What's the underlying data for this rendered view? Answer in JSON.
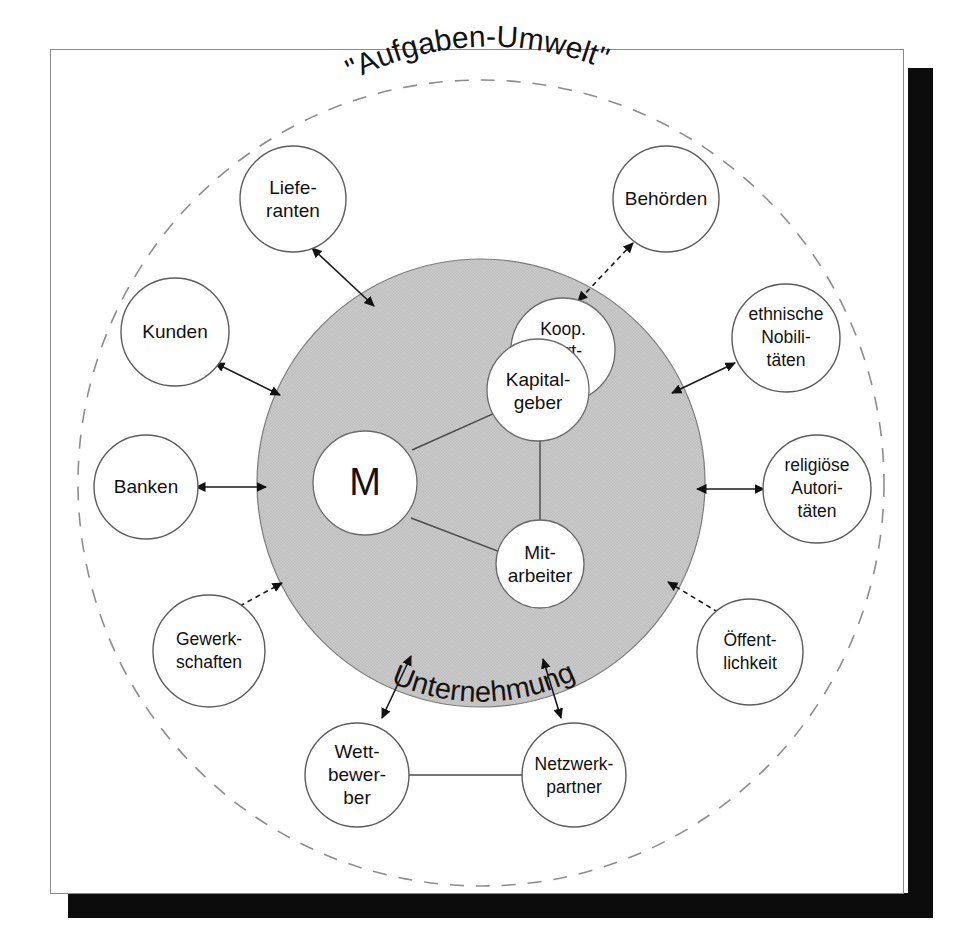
{
  "figure": {
    "title": "\"Aufgaben-Umwelt\"",
    "inner_region_label": "Unternehmung",
    "center_node": "M"
  },
  "inner_nodes": [
    {
      "id": "kapitalgeber",
      "lines": [
        "Kapital-",
        "geber"
      ]
    },
    {
      "id": "koop-partner",
      "lines": [
        "Koop.",
        "Part-",
        "ner"
      ]
    },
    {
      "id": "mitarbeiter",
      "lines": [
        "Mit-",
        "arbeiter"
      ]
    }
  ],
  "outer_nodes": [
    {
      "id": "lieferanten",
      "lines": [
        "Liefe-",
        "ranten"
      ],
      "arrow": "solid"
    },
    {
      "id": "behoerden",
      "lines": [
        "Behörden"
      ],
      "arrow": "dashed"
    },
    {
      "id": "kunden",
      "lines": [
        "Kunden"
      ],
      "arrow": "solid"
    },
    {
      "id": "ethnische-nobilitaeten",
      "lines": [
        "ethnische",
        "Nobili-",
        "täten"
      ],
      "arrow": "solid"
    },
    {
      "id": "banken",
      "lines": [
        "Banken"
      ],
      "arrow": "solid"
    },
    {
      "id": "religioese-autoritaeten",
      "lines": [
        "religiöse",
        "Autori-",
        "täten"
      ],
      "arrow": "solid"
    },
    {
      "id": "gewerkschaften",
      "lines": [
        "Gewerk-",
        "schaften"
      ],
      "arrow": "dashed"
    },
    {
      "id": "oeffentlichkeit",
      "lines": [
        "Öffent-",
        "lichkeit"
      ],
      "arrow": "dashed"
    },
    {
      "id": "wettbewerber",
      "lines": [
        "Wett-",
        "bewer-",
        "ber"
      ],
      "arrow": "solid"
    },
    {
      "id": "netzwerkpartner",
      "lines": [
        "Netzwerk-",
        "partner"
      ],
      "arrow": "solid"
    }
  ],
  "colors": {
    "panel_background": "#ffffff",
    "shadow": "#0c0c0c",
    "inner_disc_fill": "#c9c9c9",
    "stroke": "#1a1a1a",
    "dashed_boundary": "#8d8d8d"
  }
}
